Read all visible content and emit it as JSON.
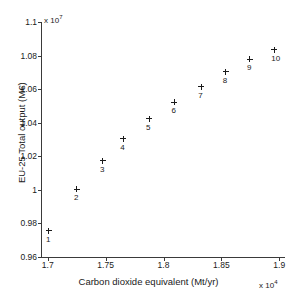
{
  "chart_data": {
    "type": "scatter",
    "title": "",
    "xlabel": "Carbon dioxide equivalent (Mt/yr)",
    "ylabel": "EU-25 Total output (M€)",
    "x_exponent_prefix": "x 10",
    "x_exponent_power": "4",
    "y_exponent_prefix": "x 10",
    "y_exponent_power": "7",
    "xlim": [
      16950,
      19050
    ],
    "ylim": [
      9600000,
      11000000
    ],
    "xticks": [
      17000,
      17500,
      18000,
      18500,
      19000
    ],
    "xtick_labels": [
      "1.7",
      "1.75",
      "1.8",
      "1.85",
      "1.9"
    ],
    "yticks": [
      9600000,
      9800000,
      10000000,
      10200000,
      10400000,
      10600000,
      10800000,
      11000000
    ],
    "ytick_labels": [
      "0.96",
      "0.98",
      "1",
      "1.02",
      "1.04",
      "1.06",
      "1.08",
      "1.1"
    ],
    "grid": false,
    "legend": false,
    "marker": "+",
    "marker_color": "#1a1a1a",
    "points": [
      {
        "label": "1",
        "x": 17010,
        "y": 9757000
      },
      {
        "label": "2",
        "x": 17252,
        "y": 10003000
      },
      {
        "label": "3",
        "x": 17477,
        "y": 10172000
      },
      {
        "label": "4",
        "x": 17652,
        "y": 10305000
      },
      {
        "label": "5",
        "x": 17875,
        "y": 10423000
      },
      {
        "label": "6",
        "x": 18095,
        "y": 10521000
      },
      {
        "label": "7",
        "x": 18327,
        "y": 10613000
      },
      {
        "label": "8",
        "x": 18537,
        "y": 10703000
      },
      {
        "label": "9",
        "x": 18747,
        "y": 10778000
      },
      {
        "label": "10",
        "x": 18958,
        "y": 10835000
      }
    ]
  }
}
